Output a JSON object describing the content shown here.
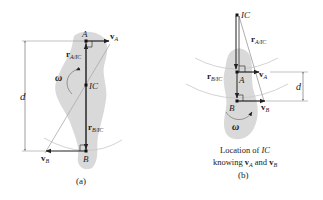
{
  "figure": {
    "panel_a": {
      "caption": "(a)",
      "labels": {
        "point_A": "A",
        "point_B": "B",
        "point_IC": "IC",
        "omega": "ω",
        "distance": "d",
        "vA": "v",
        "vA_sub": "A",
        "vB": "v",
        "vB_sub": "B",
        "rA": "r",
        "rA_sub": "A/IC",
        "rB": "r",
        "rB_sub": "B/IC"
      }
    },
    "panel_b": {
      "caption_line1": "Location of IC",
      "caption_line1_prefix": "Location of ",
      "caption_line1_ic": "IC",
      "caption_line2_prefix": "knowing ",
      "caption_line2_v1": "v",
      "caption_line2_v1_sub": "A",
      "caption_line2_mid": " and ",
      "caption_line2_v2": "v",
      "caption_line2_v2_sub": "B",
      "caption": "(b)",
      "labels": {
        "point_A": "A",
        "point_B": "B",
        "point_IC": "IC",
        "omega": "ω",
        "distance": "d",
        "vA": "v",
        "vA_sub": "A",
        "vB": "v",
        "vB_sub": "B",
        "rA": "r",
        "rA_sub": "A/IC",
        "rB": "r",
        "rB_sub": "B/IC"
      }
    },
    "colors": {
      "body": "#d9d9d9",
      "line": "#333333",
      "guide": "#999999",
      "arc": "#c8c8c8"
    }
  }
}
